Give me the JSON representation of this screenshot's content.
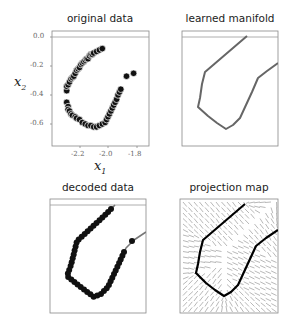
{
  "chart_data": [
    {
      "type": "scatter",
      "title": "original data",
      "xlabel": "x1",
      "ylabel": "x2",
      "xticks": [
        "-2.2",
        "-2.0",
        "-1.8"
      ],
      "yticks": [
        "0.0",
        "-0.2",
        "-0.4",
        "-0.6"
      ],
      "xlim": [
        -2.33,
        -1.71
      ],
      "ylim": [
        -0.75,
        0.04
      ],
      "hline": 0.0,
      "grid": false,
      "points": [
        [
          -2.29,
          -0.37
        ],
        [
          -2.29,
          -0.34
        ],
        [
          -2.28,
          -0.33
        ],
        [
          -2.27,
          -0.31
        ],
        [
          -2.26,
          -0.29
        ],
        [
          -2.25,
          -0.28
        ],
        [
          -2.24,
          -0.27
        ],
        [
          -2.23,
          -0.25
        ],
        [
          -2.22,
          -0.23
        ],
        [
          -2.21,
          -0.22
        ],
        [
          -2.2,
          -0.21
        ],
        [
          -2.19,
          -0.19
        ],
        [
          -2.18,
          -0.18
        ],
        [
          -2.17,
          -0.17
        ],
        [
          -2.16,
          -0.16
        ],
        [
          -2.15,
          -0.15
        ],
        [
          -2.14,
          -0.15
        ],
        [
          -2.13,
          -0.13
        ],
        [
          -2.12,
          -0.12
        ],
        [
          -2.11,
          -0.12
        ],
        [
          -2.1,
          -0.11
        ],
        [
          -2.08,
          -0.1
        ],
        [
          -2.06,
          -0.09
        ],
        [
          -2.04,
          -0.08
        ],
        [
          -2.29,
          -0.45
        ],
        [
          -2.28,
          -0.48
        ],
        [
          -2.28,
          -0.5
        ],
        [
          -2.27,
          -0.51
        ],
        [
          -2.26,
          -0.53
        ],
        [
          -2.25,
          -0.54
        ],
        [
          -2.23,
          -0.55
        ],
        [
          -2.22,
          -0.56
        ],
        [
          -2.2,
          -0.57
        ],
        [
          -2.18,
          -0.59
        ],
        [
          -2.16,
          -0.6
        ],
        [
          -2.14,
          -0.61
        ],
        [
          -2.12,
          -0.61
        ],
        [
          -2.1,
          -0.62
        ],
        [
          -2.08,
          -0.62
        ],
        [
          -2.06,
          -0.61
        ],
        [
          -2.04,
          -0.6
        ],
        [
          -2.02,
          -0.59
        ],
        [
          -2.01,
          -0.57
        ],
        [
          -2.0,
          -0.55
        ],
        [
          -1.99,
          -0.53
        ],
        [
          -1.98,
          -0.51
        ],
        [
          -1.97,
          -0.49
        ],
        [
          -1.96,
          -0.47
        ],
        [
          -1.95,
          -0.45
        ],
        [
          -1.94,
          -0.43
        ],
        [
          -1.93,
          -0.4
        ],
        [
          -1.92,
          -0.38
        ],
        [
          -1.91,
          -0.36
        ],
        [
          -1.87,
          -0.27
        ],
        [
          -1.82,
          -0.25
        ]
      ]
    },
    {
      "type": "line",
      "title": "learned manifold",
      "hline": 0.0,
      "grid": false
    },
    {
      "type": "scatter",
      "title": "decoded data",
      "hline": 0.0,
      "grid": false
    },
    {
      "type": "heatmap",
      "title": "projection map",
      "description": "vector field of projection arrows with learned manifold curve overlaid",
      "grid": false
    }
  ],
  "panels": {
    "p1": {
      "title": "original data",
      "xlabel": "x",
      "xlabel_sub": "1",
      "ylabel": "x",
      "ylabel_sub": "2",
      "xticks": [
        "-2.2",
        "-2.0",
        "-1.8"
      ],
      "yticks": [
        "0.0",
        "-0.2",
        "-0.4",
        "-0.6"
      ]
    },
    "p2": {
      "title": "learned manifold"
    },
    "p3": {
      "title": "decoded data"
    },
    "p4": {
      "title": "projection map"
    }
  },
  "colors": {
    "points": "#111111",
    "manifold": "#666666",
    "manifold_dark": "#000000",
    "arrows": "#9a9a9a",
    "frame": "#888888"
  }
}
